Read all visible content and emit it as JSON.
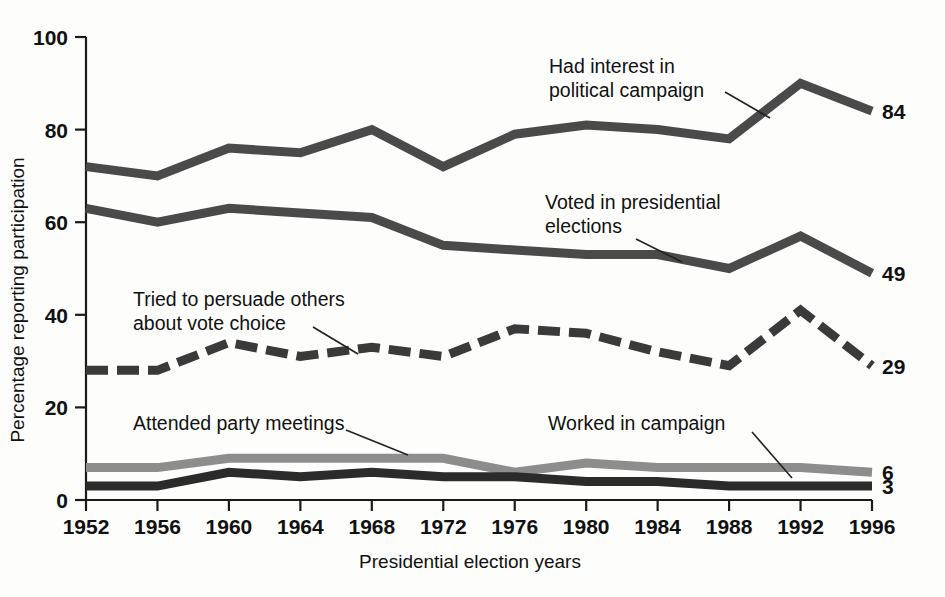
{
  "chart_data": {
    "type": "line",
    "title": "",
    "xlabel": "Presidential election years",
    "ylabel": "Percentage reporting participation",
    "x": [
      1952,
      1956,
      1960,
      1964,
      1968,
      1972,
      1976,
      1980,
      1984,
      1988,
      1992,
      1996
    ],
    "categories": [
      "1952",
      "1956",
      "1960",
      "1964",
      "1968",
      "1972",
      "1976",
      "1980",
      "1984",
      "1988",
      "1992",
      "1996"
    ],
    "xlim": [
      1952,
      1996
    ],
    "ylim": [
      0,
      100
    ],
    "yticks": [
      0,
      20,
      40,
      60,
      80,
      100
    ],
    "ytick_labels": [
      "0",
      "20",
      "40",
      "60",
      "80",
      "100"
    ],
    "grid": false,
    "legend": "inline-annotations",
    "series": [
      {
        "name": "Had interest in political campaign",
        "style": "solid",
        "color": "#4a4a4a",
        "end_label": "84",
        "values": [
          72,
          70,
          76,
          75,
          80,
          72,
          79,
          81,
          80,
          78,
          90,
          84
        ]
      },
      {
        "name": "Voted in presidential elections",
        "style": "solid",
        "color": "#4a4a4a",
        "end_label": "49",
        "values": [
          63,
          60,
          63,
          62,
          61,
          55,
          54,
          53,
          53,
          50,
          57,
          49
        ]
      },
      {
        "name": "Tried to persuade others about vote choice",
        "style": "dashed",
        "color": "#3a3a3a",
        "end_label": "29",
        "values": [
          28,
          28,
          34,
          31,
          33,
          31,
          37,
          36,
          32,
          29,
          41,
          29
        ]
      },
      {
        "name": "Attended party meetings",
        "style": "solid",
        "color": "#8d8d8d",
        "end_label": "6",
        "values": [
          7,
          7,
          9,
          9,
          9,
          9,
          6,
          8,
          7,
          7,
          7,
          6
        ]
      },
      {
        "name": "Worked in campaign",
        "style": "solid",
        "color": "#2b2b2b",
        "end_label": "3",
        "values": [
          3,
          3,
          6,
          5,
          6,
          5,
          5,
          4,
          4,
          3,
          3,
          3
        ]
      }
    ],
    "annotations": [
      {
        "id": "interest",
        "lines": [
          "Had interest in",
          "political campaign"
        ]
      },
      {
        "id": "voted",
        "lines": [
          "Voted in presidential",
          "elections"
        ]
      },
      {
        "id": "persuade",
        "lines": [
          "Tried to persuade others",
          "about vote choice"
        ]
      },
      {
        "id": "meetings",
        "lines": [
          "Attended party meetings"
        ]
      },
      {
        "id": "worked",
        "lines": [
          "Worked in campaign"
        ]
      }
    ]
  },
  "axis": {
    "y_title": "Percentage reporting participation",
    "x_title": "Presidential election years",
    "y_ticks": [
      "100",
      "80",
      "60",
      "40",
      "20",
      "0"
    ],
    "x_ticks": [
      "1952",
      "1956",
      "1960",
      "1964",
      "1968",
      "1972",
      "1976",
      "1980",
      "1984",
      "1988",
      "1992",
      "1996"
    ]
  },
  "end_labels": {
    "interest": "84",
    "voted": "49",
    "persuade": "29",
    "meetings": "6",
    "worked": "3"
  },
  "annotations": {
    "interest_l1": "Had interest in",
    "interest_l2": "political campaign",
    "voted_l1": "Voted in presidential",
    "voted_l2": "elections",
    "persuade_l1": "Tried to persuade others",
    "persuade_l2": "about vote choice",
    "meetings_l1": "Attended party meetings",
    "worked_l1": "Worked in campaign"
  },
  "colors": {
    "interest_line": "#4a4a4a",
    "voted_line": "#4a4a4a",
    "persuade_line": "#3a3a3a",
    "meetings_line": "#8d8d8d",
    "worked_line": "#2b2b2b",
    "axis": "#1a1a1a",
    "text": "#111111",
    "background": "#fdfdfc"
  }
}
